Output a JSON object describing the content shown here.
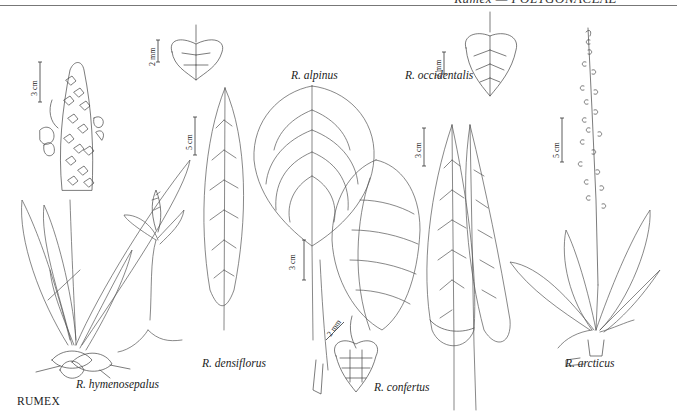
{
  "header": {
    "running_title": "Rumex — POLYGONACEAE"
  },
  "plate": {
    "genus_caption": "RUMEX",
    "species": [
      {
        "name": "R. hymenosepalus"
      },
      {
        "name": "R. densiflorus"
      },
      {
        "name": "R. alpinus"
      },
      {
        "name": "R. confertus"
      },
      {
        "name": "R. occidentalis"
      },
      {
        "name": "R. arcticus"
      }
    ],
    "scale_bars": {
      "hymenosepalus_plant": "3 cm",
      "densiflorus_fruit": "2 mm",
      "densiflorus_leaf": "5 cm",
      "alpinus_leaf": "3 cm",
      "confertus_fruit": "2 mm",
      "occidentalis_fruit": "2 mm",
      "occidentalis_leaf": "3 cm",
      "arcticus_plant": "5 cm"
    }
  }
}
